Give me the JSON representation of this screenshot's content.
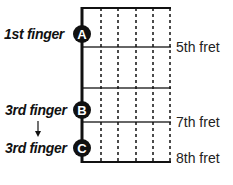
{
  "diagram": {
    "fingers": [
      {
        "label": "1st finger",
        "marker": "A",
        "cy": 34
      },
      {
        "label": "3rd finger",
        "marker": "B",
        "cy": 110
      },
      {
        "label": "3rd finger",
        "marker": "C",
        "cy": 148
      }
    ],
    "frets": [
      {
        "label": "5th fret",
        "y": 47
      },
      {
        "label": "",
        "y": 88
      },
      {
        "label": "7th fret",
        "y": 122
      },
      {
        "label": "8th fret",
        "y": 162
      }
    ],
    "arrow": {
      "from": "B",
      "to": "C",
      "direction": "down"
    },
    "colors": {
      "ink": "#111111",
      "fret_line": "#333333",
      "background": "#ffffff"
    }
  }
}
